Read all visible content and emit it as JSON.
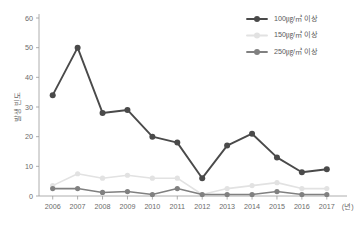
{
  "chart_data": {
    "type": "line",
    "title": "",
    "subtitle": "",
    "xlabel": "(년)",
    "ylabel": "발생 빈도",
    "categories": [
      "2006",
      "2007",
      "2008",
      "2009",
      "2010",
      "2011",
      "2012",
      "2013",
      "2014",
      "2015",
      "2016",
      "2017"
    ],
    "x": [
      2006,
      2007,
      2008,
      2009,
      2010,
      2011,
      2012,
      2013,
      2014,
      2015,
      2016,
      2017
    ],
    "ylim": [
      0,
      60
    ],
    "yticks": [
      0,
      10,
      20,
      30,
      40,
      50,
      60
    ],
    "ytick_labels": [
      "0",
      "10",
      "20",
      "30",
      "40",
      "50",
      "60"
    ],
    "grid": false,
    "legend_position": "top-right",
    "series": [
      {
        "name": "100㎍/㎥ 이상",
        "color": "#4a4a4a",
        "values": [
          34,
          50,
          28,
          29,
          20,
          18,
          6,
          17,
          21,
          13,
          8,
          9
        ]
      },
      {
        "name": "150㎍/㎥ 이상",
        "color": "#e2e2e2",
        "values": [
          3.5,
          7.5,
          6,
          7,
          6,
          6,
          0.5,
          2.5,
          3.5,
          4.5,
          2.5,
          2.5
        ]
      },
      {
        "name": "250㎍/㎥ 이상",
        "color": "#808080",
        "values": [
          2.5,
          2.5,
          1.2,
          1.5,
          0.5,
          2.5,
          0.5,
          0.5,
          0.5,
          1.5,
          0.5,
          0.5
        ]
      }
    ]
  },
  "legend": {
    "items": [
      {
        "label": "100㎍/㎥ 이상",
        "color": "#4a4a4a"
      },
      {
        "label": "150㎍/㎥ 이상",
        "color": "#e2e2e2"
      },
      {
        "label": "250㎍/㎥ 이상",
        "color": "#808080"
      }
    ]
  },
  "axes": {
    "y_title": "발생 빈도",
    "x_unit": "(년)"
  },
  "colors": {
    "axis": "#9a9a9a",
    "tick_label": "#6b6b6b",
    "background": "#ffffff"
  }
}
